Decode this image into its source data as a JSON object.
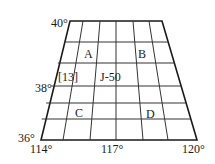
{
  "map": {
    "type": "map-sheet-grid",
    "latitude_labels": {
      "top": "40°",
      "middle": "38°",
      "bottom": "36°"
    },
    "longitude_labels": {
      "left": "114°",
      "middle": "117°",
      "right": "120°"
    },
    "cell_labels": {
      "A": "A",
      "B": "B",
      "C": "C",
      "D": "D",
      "sheet_index": "[13]",
      "sheet_code": "J-50"
    },
    "grid": {
      "columns": 6,
      "rows": 6
    },
    "colors": {
      "line": "#1a1a1a",
      "background": "#ffffff"
    }
  }
}
